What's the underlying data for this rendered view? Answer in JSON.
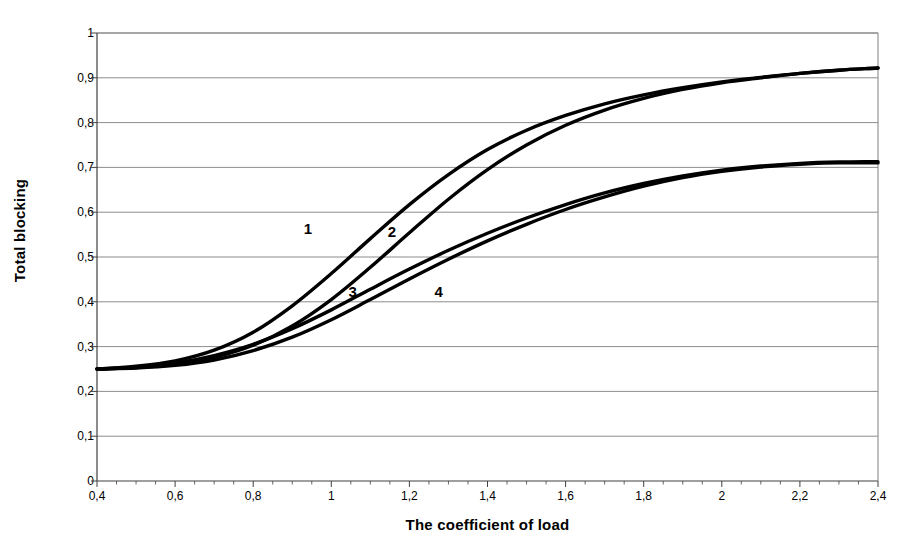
{
  "chart_data": {
    "type": "line",
    "title": "",
    "xlabel": "The coefficient of load",
    "ylabel": "Total blocking",
    "xlim": [
      0.4,
      2.4
    ],
    "ylim": [
      0,
      1
    ],
    "grid": true,
    "legend_position": "inline-curve-labels",
    "decimal_separator": ",",
    "x_ticks": [
      "0,4",
      "0,6",
      "0,8",
      "1",
      "1,2",
      "1,4",
      "1,6",
      "1,8",
      "2",
      "2,2",
      "2,4"
    ],
    "x_tick_values": [
      0.4,
      0.6,
      0.8,
      1.0,
      1.2,
      1.4,
      1.6,
      1.8,
      2.0,
      2.2,
      2.4
    ],
    "x_minor_tick_step": 0.05,
    "y_ticks": [
      "0",
      "0,1",
      "0,2",
      "0,3",
      "0,4",
      "0,5",
      "0,6",
      "0,7",
      "0,8",
      "0,9",
      "1"
    ],
    "y_tick_values": [
      0,
      0.1,
      0.2,
      0.3,
      0.4,
      0.5,
      0.6,
      0.7,
      0.8,
      0.9,
      1.0
    ],
    "x": [
      0.4,
      0.5,
      0.6,
      0.7,
      0.8,
      0.9,
      1.0,
      1.1,
      1.2,
      1.3,
      1.4,
      1.5,
      1.6,
      1.7,
      1.8,
      1.9,
      2.0,
      2.1,
      2.2,
      2.3,
      2.4
    ],
    "series": [
      {
        "name": "1",
        "label": "1",
        "color": "#000000",
        "label_x": 0.94,
        "label_y": 0.565,
        "values": [
          0.25,
          0.256,
          0.268,
          0.292,
          0.332,
          0.391,
          0.463,
          0.541,
          0.617,
          0.684,
          0.74,
          0.783,
          0.816,
          0.842,
          0.862,
          0.878,
          0.891,
          0.901,
          0.91,
          0.917,
          0.922
        ]
      },
      {
        "name": "2",
        "label": "2",
        "color": "#000000",
        "label_x": 1.155,
        "label_y": 0.558,
        "values": [
          0.25,
          0.253,
          0.261,
          0.276,
          0.303,
          0.346,
          0.405,
          0.477,
          0.554,
          0.629,
          0.695,
          0.75,
          0.794,
          0.828,
          0.854,
          0.874,
          0.889,
          0.9,
          0.91,
          0.917,
          0.922
        ]
      },
      {
        "name": "3",
        "label": "3",
        "color": "#000000",
        "label_x": 1.055,
        "label_y": 0.425,
        "values": [
          0.25,
          0.254,
          0.263,
          0.28,
          0.305,
          0.34,
          0.382,
          0.428,
          0.473,
          0.515,
          0.553,
          0.587,
          0.617,
          0.643,
          0.664,
          0.681,
          0.694,
          0.703,
          0.709,
          0.712,
          0.713
        ]
      },
      {
        "name": "4",
        "label": "4",
        "color": "#000000",
        "label_x": 1.275,
        "label_y": 0.425,
        "values": [
          0.25,
          0.252,
          0.258,
          0.27,
          0.291,
          0.321,
          0.36,
          0.405,
          0.451,
          0.495,
          0.536,
          0.573,
          0.606,
          0.634,
          0.658,
          0.677,
          0.691,
          0.701,
          0.707,
          0.71,
          0.71
        ]
      }
    ]
  },
  "figure": {
    "background_color": "#ffffff",
    "grid_color": "#808080",
    "axis_color": "#404040",
    "curve_color": "#000000"
  }
}
